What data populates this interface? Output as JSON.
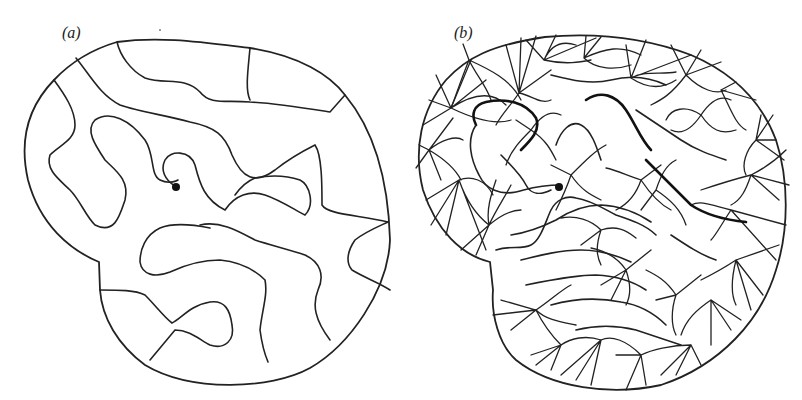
{
  "figure": {
    "panels": [
      {
        "id": "a",
        "label": "(a)",
        "description": "Single-contour pattern: meandering lines spanning a domain with a spiral core point"
      },
      {
        "id": "b",
        "label": "(b)",
        "description": "Dense multi-contour pattern on the same domain with many star-shaped vertices"
      }
    ],
    "colors": {
      "line": "#222222",
      "background": "#ffffff"
    }
  }
}
